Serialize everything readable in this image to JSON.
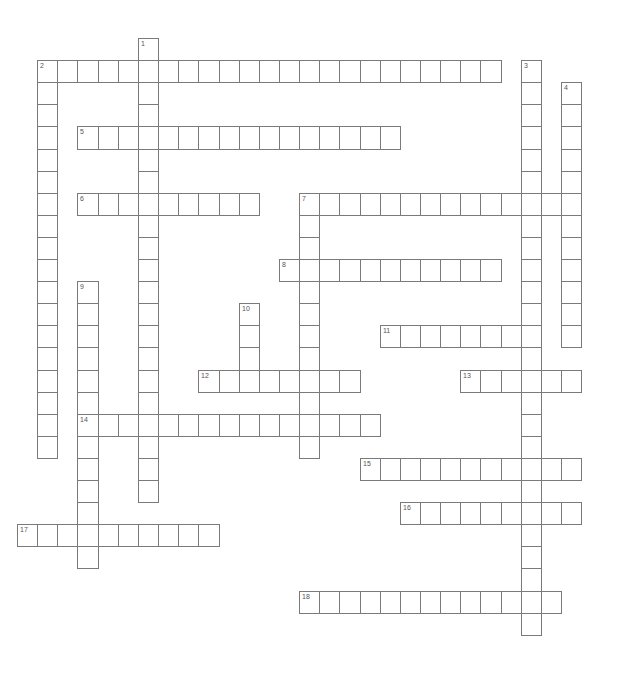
{
  "puzzle": {
    "type": "crossword",
    "cell_width": 20.15,
    "cell_height": 22.1,
    "origin_x": 17,
    "origin_y": 38,
    "border_color": "#7a7a7a",
    "number_color": "#555555"
  },
  "words": [
    {
      "number": "1",
      "direction": "down",
      "col": 6,
      "row": 0,
      "length": 21
    },
    {
      "number": "2",
      "direction": "across",
      "col": 1,
      "row": 1,
      "length": 23
    },
    {
      "number": "2",
      "direction": "down",
      "col": 1,
      "row": 1,
      "length": 18
    },
    {
      "number": "3",
      "direction": "down",
      "col": 25,
      "row": 1,
      "length": 26
    },
    {
      "number": "4",
      "direction": "down",
      "col": 27,
      "row": 2,
      "length": 12
    },
    {
      "number": "5",
      "direction": "across",
      "col": 3,
      "row": 4,
      "length": 16
    },
    {
      "number": "6",
      "direction": "across",
      "col": 3,
      "row": 7,
      "length": 9
    },
    {
      "number": "7",
      "direction": "across",
      "col": 14,
      "row": 7,
      "length": 14
    },
    {
      "number": "7",
      "direction": "down",
      "col": 14,
      "row": 7,
      "length": 12
    },
    {
      "number": "8",
      "direction": "across",
      "col": 13,
      "row": 10,
      "length": 11
    },
    {
      "number": "9",
      "direction": "down",
      "col": 3,
      "row": 11,
      "length": 13
    },
    {
      "number": "10",
      "direction": "down",
      "col": 11,
      "row": 12,
      "length": 4
    },
    {
      "number": "11",
      "direction": "across",
      "col": 18,
      "row": 13,
      "length": 8
    },
    {
      "number": "12",
      "direction": "across",
      "col": 9,
      "row": 15,
      "length": 8
    },
    {
      "number": "13",
      "direction": "across",
      "col": 22,
      "row": 15,
      "length": 6
    },
    {
      "number": "14",
      "direction": "across",
      "col": 3,
      "row": 17,
      "length": 15
    },
    {
      "number": "15",
      "direction": "across",
      "col": 17,
      "row": 19,
      "length": 11
    },
    {
      "number": "16",
      "direction": "across",
      "col": 19,
      "row": 21,
      "length": 9
    },
    {
      "number": "17",
      "direction": "across",
      "col": 0,
      "row": 22,
      "length": 10
    },
    {
      "number": "18",
      "direction": "across",
      "col": 14,
      "row": 25,
      "length": 13
    }
  ]
}
